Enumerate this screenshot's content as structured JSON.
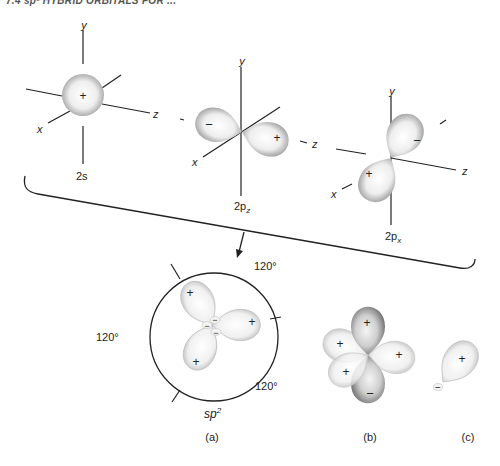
{
  "header": {
    "text": "7.4  sp² HYBRID ORBITALS FOR ..."
  },
  "orbitals": {
    "s2": {
      "label": "2s",
      "sign": "+",
      "axes": {
        "x": "x",
        "y": "y",
        "z": "z"
      }
    },
    "p2z": {
      "label_main": "2p",
      "label_sub": "z",
      "left_sign": "−",
      "right_sign": "+",
      "axes": {
        "x": "x",
        "y": "y",
        "z": "z"
      }
    },
    "p2x": {
      "label_main": "2p",
      "label_sub": "x",
      "front_sign": "+",
      "back_sign": "−",
      "axes": {
        "x": "x",
        "y": "y",
        "z": "z"
      }
    }
  },
  "hybrid": {
    "label_main": "sp",
    "label_sup": "2",
    "panel_label": "(a)",
    "angles": [
      "120°",
      "120°",
      "120°"
    ],
    "lobe_signs": [
      "+",
      "+",
      "+"
    ],
    "center_signs": [
      "−",
      "−",
      "−"
    ]
  },
  "combined": {
    "panel_label": "(b)",
    "signs": [
      "+",
      "+",
      "+",
      "+",
      "−"
    ]
  },
  "single": {
    "panel_label": "(c)",
    "big_sign": "+",
    "small_sign": "−"
  },
  "colors": {
    "lobe_fill": "#f2f2f2",
    "lobe_edge": "#9a9a9a",
    "dark_lobe": "#7a7a7a",
    "line": "#222222"
  }
}
